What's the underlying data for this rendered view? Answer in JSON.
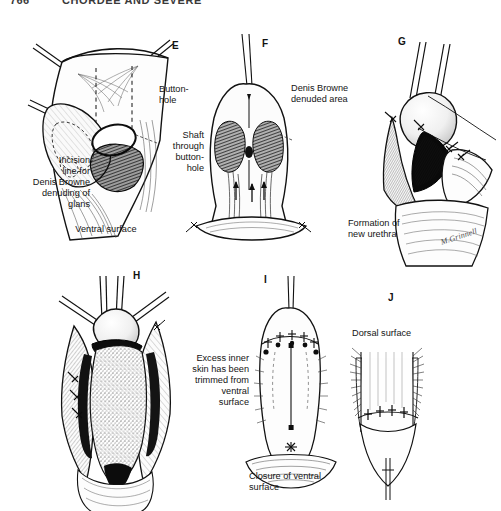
{
  "running_head": {
    "page_number": "766",
    "title": "CHORDEE AND SEVERE"
  },
  "figure": {
    "panels": [
      {
        "letter": "E",
        "captions": [
          "Button-\nhole",
          "Incision\nline for\nDenis Browne\ndenuding of\nglans",
          "Ventral surface"
        ]
      },
      {
        "letter": "F",
        "captions": [
          "Denis Browne\ndenuded area",
          "Shaft\nthrough\nbutton-\nhole"
        ]
      },
      {
        "letter": "G",
        "captions": [
          "Formation of\nnew urethra"
        ]
      },
      {
        "letter": "H",
        "captions": [
          "Excess inner\nskin has been\ntrimmed from\nventral\nsurface"
        ]
      },
      {
        "letter": "I",
        "captions": [
          "Closure of ventral\nsurface"
        ]
      },
      {
        "letter": "J",
        "captions": [
          "Dorsal surface"
        ]
      }
    ],
    "labels": {
      "buttonhole": "Button-\nhole",
      "incision_line": "Incision\nline for\nDenis Browne\ndenuding of\nglans",
      "ventral_surface": "Ventral surface",
      "denuded_area": "Denis Browne\ndenuded area",
      "shaft_through": "Shaft\nthrough\nbutton-\nhole",
      "new_urethra": "Formation of\nnew urethra",
      "excess_skin": "Excess inner\nskin has been\ntrimmed from\nventral\nsurface",
      "closure_ventral": "Closure of ventral\nsurface",
      "dorsal_surface": "Dorsal surface"
    },
    "letters": {
      "e": "E",
      "f": "F",
      "g": "G",
      "h": "H",
      "i": "I",
      "j": "J"
    },
    "artist_signature": "M.Grinnell"
  },
  "colors": {
    "ink": "#141414",
    "paper": "#ffffff",
    "wash": "#6b6b6b"
  }
}
